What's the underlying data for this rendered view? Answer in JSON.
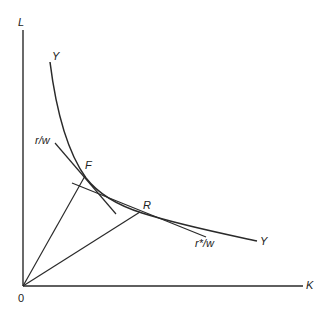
{
  "diagram": {
    "title": "",
    "axes": {
      "y_label": "L",
      "x_label": "K",
      "origin_label": "0"
    },
    "curve": {
      "name": "isoquant",
      "label_top": "Y",
      "label_bottom": "Y"
    },
    "tangents": [
      {
        "label": "r/w",
        "point": "F"
      },
      {
        "label": "r*/w",
        "point": "R"
      }
    ],
    "points": [
      {
        "label": "F"
      },
      {
        "label": "R"
      }
    ],
    "colors": {
      "line": "#2a2a2a",
      "background": "#ffffff"
    }
  }
}
